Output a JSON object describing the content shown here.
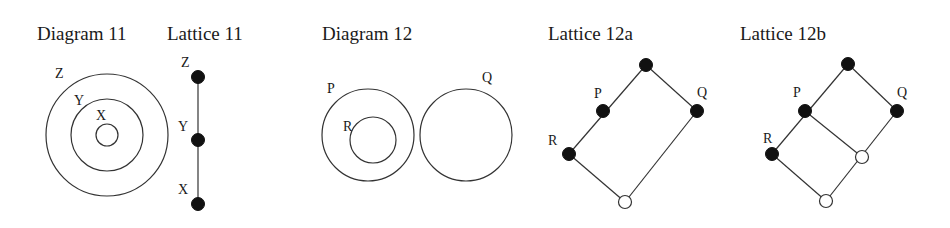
{
  "colors": {
    "background": "#ffffff",
    "ink": "#111111",
    "stroke": "#333333"
  },
  "titles": {
    "diagram11": "Diagram 11",
    "lattice11": "Lattice 11",
    "diagram12": "Diagram 12",
    "lattice12a": "Lattice 12a",
    "lattice12b": "Lattice 12b"
  },
  "diagram11": {
    "circles": [
      {
        "name": "Z",
        "cx": 107,
        "cy": 135,
        "r": 61
      },
      {
        "name": "Y",
        "cx": 107,
        "cy": 135,
        "r": 36
      },
      {
        "name": "X",
        "cx": 107,
        "cy": 135,
        "r": 11
      }
    ],
    "labels": {
      "Z": "Z",
      "Y": "Y",
      "X": "X"
    }
  },
  "lattice11": {
    "nodes": [
      {
        "name": "Z",
        "filled": true
      },
      {
        "name": "Y",
        "filled": true
      },
      {
        "name": "X",
        "filled": true
      }
    ],
    "labels": {
      "Z": "Z",
      "Y": "Y",
      "X": "X"
    }
  },
  "diagram12": {
    "circles": [
      {
        "name": "P",
        "cx": 368,
        "cy": 135,
        "r": 46
      },
      {
        "name": "R",
        "cx": 373,
        "cy": 140,
        "r": 23
      },
      {
        "name": "Q",
        "cx": 466,
        "cy": 135,
        "r": 46
      }
    ],
    "labels": {
      "P": "P",
      "R": "R",
      "Q": "Q"
    }
  },
  "lattice12a": {
    "nodes": [
      {
        "name": "top",
        "filled": true
      },
      {
        "name": "P",
        "filled": true
      },
      {
        "name": "Q",
        "filled": true
      },
      {
        "name": "R",
        "filled": true
      },
      {
        "name": "bottom",
        "filled": false
      }
    ],
    "labels": {
      "P": "P",
      "Q": "Q",
      "R": "R"
    }
  },
  "lattice12b": {
    "nodes": [
      {
        "name": "top",
        "filled": true
      },
      {
        "name": "P",
        "filled": true
      },
      {
        "name": "Q",
        "filled": true
      },
      {
        "name": "R",
        "filled": true
      },
      {
        "name": "middle",
        "filled": false
      },
      {
        "name": "bottom",
        "filled": false
      }
    ],
    "labels": {
      "P": "P",
      "Q": "Q",
      "R": "R"
    }
  }
}
